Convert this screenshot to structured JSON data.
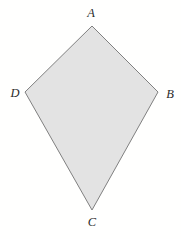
{
  "figure": {
    "kind": "geometry-diagram",
    "shape_name": "quadrilateral-kite-ABCD",
    "canvas": {
      "width": 181,
      "height": 239,
      "background": "#fffffe"
    },
    "style": {
      "fill": "#e3e3e3",
      "stroke": "#808080",
      "stroke_width": 1,
      "label_color": "#2b2b2b"
    },
    "polygon_points": "92,26 158,92 92,210 25,92",
    "vertices": [
      {
        "id": "A",
        "label": "A",
        "x": 92,
        "y": 26,
        "label_x": 91,
        "label_y": 13
      },
      {
        "id": "B",
        "label": "B",
        "x": 158,
        "y": 92,
        "label_x": 170,
        "label_y": 94
      },
      {
        "id": "C",
        "label": "C",
        "x": 92,
        "y": 210,
        "label_x": 92,
        "label_y": 222
      },
      {
        "id": "D",
        "label": "D",
        "x": 25,
        "y": 92,
        "label_x": 15,
        "label_y": 93
      }
    ]
  }
}
